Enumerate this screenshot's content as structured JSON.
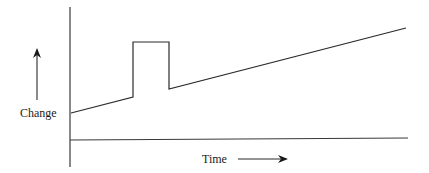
{
  "diagram": {
    "y_axis_label": "Change",
    "x_axis_label": "Time",
    "stroke_color": "#2a2a2a",
    "background": "#ffffff",
    "curve_points": [
      [
        71,
        113
      ],
      [
        133,
        97
      ],
      [
        133,
        42
      ],
      [
        169,
        42
      ],
      [
        169,
        89
      ],
      [
        406,
        28
      ]
    ],
    "axes": {
      "y_axis": {
        "x": 70,
        "y_top": 7,
        "y_bottom": 167
      },
      "x_axis": {
        "y": 140,
        "x_left": 70,
        "x_right": 408
      }
    },
    "arrows": {
      "change_arrow": {
        "x": 37,
        "y_from": 100,
        "y_to": 48,
        "direction": "up"
      },
      "time_arrow": {
        "y": 159,
        "x_from": 238,
        "x_to": 287,
        "direction": "right"
      }
    }
  }
}
